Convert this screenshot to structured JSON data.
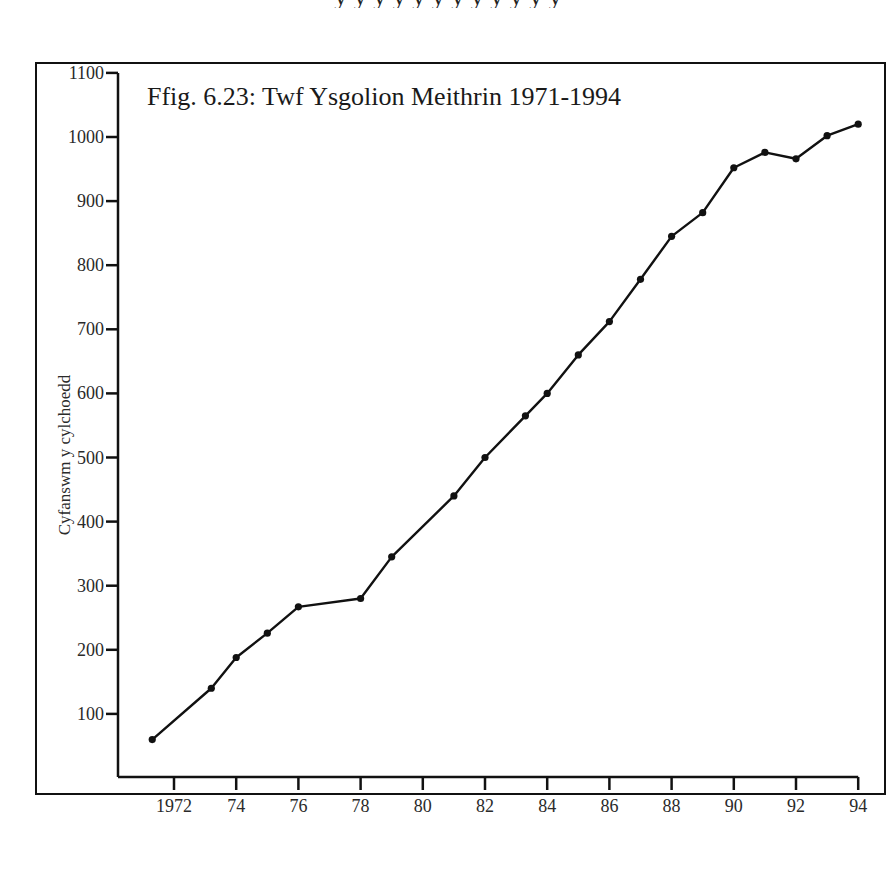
{
  "page": {
    "top_text_fragment": "y y y y y y y y y y y y"
  },
  "chart_data": {
    "type": "line",
    "title": "Ffig. 6.23: Twf Ysgolion Meithrin 1971-1994",
    "xlabel": "",
    "ylabel": "Cyfanswm y cylchoedd",
    "ylim": [
      0,
      1100
    ],
    "xlim": [
      1970.1,
      1994
    ],
    "yticks": [
      100,
      200,
      300,
      400,
      500,
      600,
      700,
      800,
      900,
      1000,
      1100
    ],
    "xticks": [
      1972,
      1974,
      1976,
      1978,
      1980,
      1982,
      1984,
      1986,
      1988,
      1990,
      1992,
      1994
    ],
    "xtick_labels": [
      "1972",
      "74",
      "76",
      "78",
      "80",
      "82",
      "84",
      "86",
      "88",
      "90",
      "92",
      "94"
    ],
    "grid": false,
    "legend": null,
    "marker": "filled-circle",
    "line_color": "#111111",
    "x": [
      1971.3,
      1973.2,
      1974,
      1975,
      1976,
      1978,
      1979,
      1981,
      1982,
      1983.3,
      1984,
      1985,
      1986,
      1987,
      1988,
      1989,
      1990,
      1991,
      1992,
      1993,
      1994
    ],
    "values": [
      60,
      140,
      188,
      226,
      267,
      280,
      345,
      440,
      500,
      565,
      600,
      660,
      712,
      778,
      845,
      882,
      952,
      976,
      966,
      1002,
      1020
    ]
  }
}
